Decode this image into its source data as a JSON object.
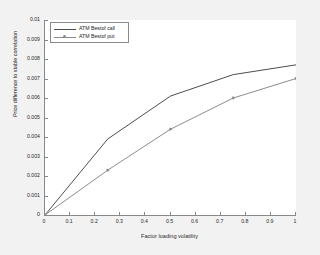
{
  "chart_data": {
    "type": "line",
    "title": "",
    "xlabel": "Factor loading volatility",
    "ylabel": "Price difference to stable correlation",
    "xlim": [
      0,
      1
    ],
    "ylim": [
      0,
      0.01
    ],
    "grid": false,
    "legend_position": "upper left",
    "x": [
      0,
      0.25,
      0.5,
      0.75,
      1
    ],
    "series": [
      {
        "name": "ATM Bestof call",
        "color": "#4d4d4d",
        "marker": "none",
        "values": [
          0,
          0.0039,
          0.0061,
          0.0072,
          0.0077
        ]
      },
      {
        "name": "ATM Bestof put",
        "color": "#8c8c8c",
        "marker": "circle",
        "values": [
          0,
          0.0023,
          0.0044,
          0.006,
          0.007
        ]
      }
    ],
    "xticks": [
      {
        "value": 0,
        "label": "0"
      },
      {
        "value": 0.1,
        "label": "0.1"
      },
      {
        "value": 0.2,
        "label": "0.2"
      },
      {
        "value": 0.3,
        "label": "0.3"
      },
      {
        "value": 0.4,
        "label": "0.4"
      },
      {
        "value": 0.5,
        "label": "0.5"
      },
      {
        "value": 0.6,
        "label": "0.6"
      },
      {
        "value": 0.7,
        "label": "0.7"
      },
      {
        "value": 0.8,
        "label": "0.8"
      },
      {
        "value": 0.9,
        "label": "0.9"
      },
      {
        "value": 1,
        "label": "1"
      }
    ],
    "yticks": [
      {
        "value": 0,
        "label": "0"
      },
      {
        "value": 0.001,
        "label": "0.001"
      },
      {
        "value": 0.002,
        "label": "0.002"
      },
      {
        "value": 0.003,
        "label": "0.003"
      },
      {
        "value": 0.004,
        "label": "0.004"
      },
      {
        "value": 0.005,
        "label": "0.005"
      },
      {
        "value": 0.006,
        "label": "0.006"
      },
      {
        "value": 0.007,
        "label": "0.007"
      },
      {
        "value": 0.008,
        "label": "0.008"
      },
      {
        "value": 0.009,
        "label": "0.009"
      },
      {
        "value": 0.01,
        "label": "0.01"
      }
    ]
  },
  "figure": {
    "background_color": "#f2f2f2",
    "axes_background_color": "#ffffff",
    "axis_color": "#888888"
  }
}
